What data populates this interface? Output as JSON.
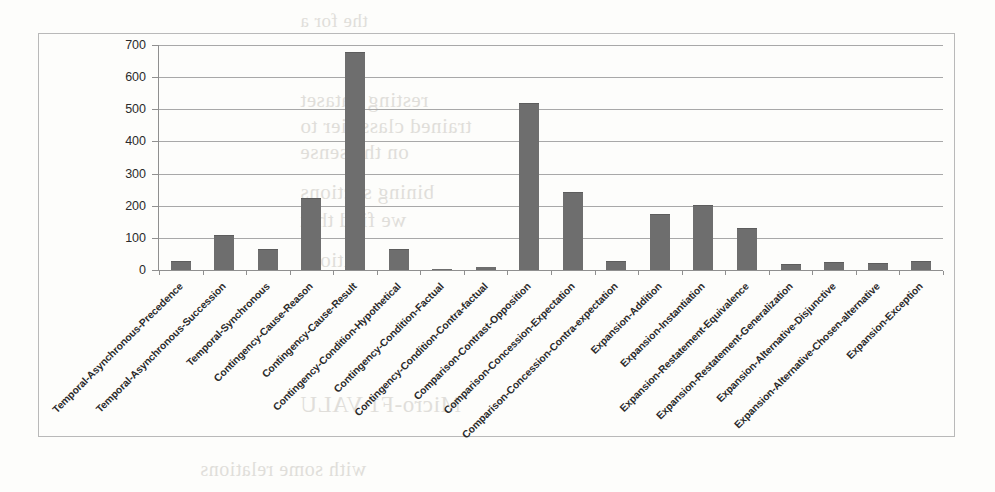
{
  "page": {
    "background_color": "#fdfdfb",
    "frame_color": "#b9b9b9",
    "bar_color": "#6e6e6e",
    "gridline_color": "#a8a8a8",
    "axis_color": "#8f8f8f",
    "text_color": "#2a2a2a"
  },
  "ghost_text": [
    {
      "text": "the for a",
      "x": 300,
      "y": 10,
      "size": 19
    },
    {
      "text": "resting dataset",
      "x": 300,
      "y": 88,
      "size": 21
    },
    {
      "text": "trained classifier to",
      "x": 300,
      "y": 114,
      "size": 21
    },
    {
      "text": "on the sense",
      "x": 300,
      "y": 140,
      "size": 21
    },
    {
      "text": "bining sections",
      "x": 300,
      "y": 180,
      "size": 21
    },
    {
      "text": "we find that",
      "x": 300,
      "y": 208,
      "size": 21
    },
    {
      "text": "ations",
      "x": 300,
      "y": 248,
      "size": 21
    },
    {
      "text": "Micro-F1 VALU",
      "x": 300,
      "y": 392,
      "size": 23
    },
    {
      "text": "with some relations",
      "x": 200,
      "y": 458,
      "size": 20
    }
  ],
  "chart_data": {
    "type": "bar",
    "title": "",
    "xlabel": "",
    "ylabel": "",
    "ylim": [
      0,
      700
    ],
    "y_ticks": [
      0,
      100,
      200,
      300,
      400,
      500,
      600,
      700
    ],
    "grid": true,
    "legend": null,
    "categories": [
      "Temporal-Asynchronous-Precedence",
      "Temporal-Asynchronous-Succession",
      "Temporal-Synchronous",
      "Contingency-Cause-Reason",
      "Contingency-Cause-Result",
      "Contingency-Condition-Hypothetical",
      "Contingency-Condition-Factual",
      "Contingency-Condition-Contra-factual",
      "Comparison-Contrast-Opposition",
      "Comparison-Concession-Expectation",
      "Comparison-Concession-Contra-expectation",
      "Expansion-Addition",
      "Expansion-Instantiation",
      "Expansion-Restatement-Equivalence",
      "Expansion-Restatement-Generalization",
      "Expansion-Alternative-Disjunctive",
      "Expansion-Alternative-Chosen-alternative",
      "Expansion-Exception"
    ],
    "values": [
      26,
      106,
      62,
      222,
      675,
      62,
      4,
      8,
      518,
      240,
      24,
      170,
      198,
      128,
      16,
      22,
      20,
      24
    ]
  }
}
